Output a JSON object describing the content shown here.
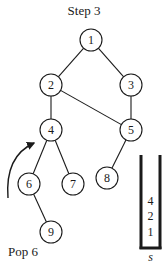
{
  "title": "Step 3",
  "caption": "Pop 6",
  "graph": {
    "nodes": [
      {
        "id": "1",
        "label": "1",
        "x": 91,
        "y": 40
      },
      {
        "id": "2",
        "label": "2",
        "x": 51,
        "y": 85
      },
      {
        "id": "3",
        "label": "3",
        "x": 131,
        "y": 85
      },
      {
        "id": "4",
        "label": "4",
        "x": 51,
        "y": 130
      },
      {
        "id": "5",
        "label": "5",
        "x": 131,
        "y": 130
      },
      {
        "id": "6",
        "label": "6",
        "x": 29,
        "y": 184
      },
      {
        "id": "7",
        "label": "7",
        "x": 73,
        "y": 184
      },
      {
        "id": "8",
        "label": "8",
        "x": 107,
        "y": 178
      },
      {
        "id": "9",
        "label": "9",
        "x": 51,
        "y": 232
      }
    ],
    "edges": [
      [
        "1",
        "2"
      ],
      [
        "1",
        "3"
      ],
      [
        "2",
        "4"
      ],
      [
        "2",
        "5"
      ],
      [
        "3",
        "5"
      ],
      [
        "4",
        "6"
      ],
      [
        "4",
        "7"
      ],
      [
        "5",
        "8"
      ],
      [
        "6",
        "9"
      ]
    ],
    "arrow": {
      "from": "6",
      "to": "4",
      "meaning": "backtrack"
    }
  },
  "stack": {
    "name": "s",
    "items_top_to_bottom": [
      "4",
      "2",
      "1"
    ]
  }
}
